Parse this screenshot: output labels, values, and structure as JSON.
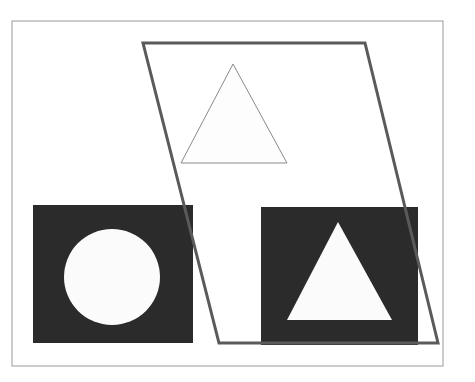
{
  "figure": {
    "background": "#ffffff",
    "frame": {
      "x": 12,
      "y": 21,
      "w": 431,
      "h": 345,
      "stroke": "#9a9a9a"
    },
    "parallelogram": {
      "points": "143,43 365,43 438,343 219,343",
      "stroke": "#5a5a5a",
      "stroke_width": 3
    },
    "outline_triangle": {
      "points": "233,64 181,163 287,163",
      "stroke": "#8a8a8a",
      "fill": "#fdfdfd"
    },
    "left_panel": {
      "x": 33,
      "y": 205,
      "w": 160,
      "h": 138,
      "fill": "#2b2b2b"
    },
    "circle": {
      "cx": 112,
      "cy": 277,
      "r": 48,
      "fill": "#fbfbfb"
    },
    "right_panel": {
      "x": 261,
      "y": 207,
      "w": 157,
      "h": 138,
      "fill": "#2b2b2b"
    },
    "solid_triangle": {
      "points": "338,222 287,320 392,320",
      "fill": "#fbfbfb"
    }
  }
}
